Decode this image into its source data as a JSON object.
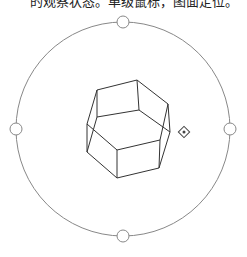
{
  "caption": "的观察状态。单级鼠标，图面定位。",
  "orbit": {
    "center": [
      123,
      129
    ],
    "radius": 107,
    "stroke": "#888888",
    "grips": [
      {
        "name": "grip-top",
        "cx": 123,
        "cy": 22
      },
      {
        "name": "grip-bottom",
        "cx": 123,
        "cy": 236
      },
      {
        "name": "grip-left",
        "cx": 16,
        "cy": 129
      },
      {
        "name": "grip-right",
        "cx": 230,
        "cy": 129
      }
    ],
    "grip_radius": 6
  },
  "prism": {
    "stroke": "#333333",
    "edges": [
      [
        97,
        90,
        137,
        80
      ],
      [
        137,
        80,
        168,
        104
      ],
      [
        97,
        90,
        97,
        117
      ],
      [
        137,
        80,
        139,
        110
      ],
      [
        97,
        117,
        139,
        110
      ],
      [
        139,
        110,
        170,
        132
      ],
      [
        168,
        104,
        170,
        132
      ],
      [
        97,
        90,
        87,
        124
      ],
      [
        87,
        124,
        87,
        152
      ],
      [
        97,
        117,
        87,
        152
      ],
      [
        87,
        124,
        117,
        150
      ],
      [
        117,
        150,
        160,
        140
      ],
      [
        160,
        140,
        168,
        104
      ],
      [
        117,
        150,
        117,
        178
      ],
      [
        117,
        178,
        159,
        168
      ],
      [
        159,
        168,
        170,
        132
      ],
      [
        160,
        140,
        159,
        168
      ],
      [
        87,
        152,
        117,
        178
      ]
    ]
  },
  "cursor": {
    "x": 184,
    "y": 132,
    "icon": "orbit-cursor-icon"
  }
}
